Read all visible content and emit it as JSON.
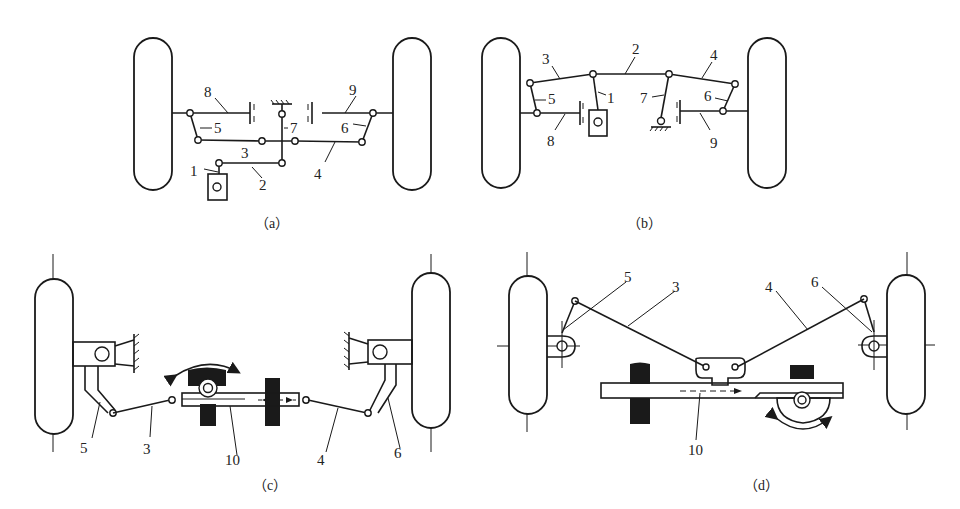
{
  "figure": {
    "panels": [
      {
        "id": "a",
        "caption": "（a）",
        "labels": {
          "n1": "1",
          "n2": "2",
          "n3": "3",
          "n4": "4",
          "n5": "5",
          "n6": "6",
          "n7": "7",
          "n8": "8",
          "n9": "9"
        }
      },
      {
        "id": "b",
        "caption": "（b）",
        "labels": {
          "n1": "1",
          "n2": "2",
          "n3": "3",
          "n4": "4",
          "n5": "5",
          "n6": "6",
          "n7": "7",
          "n8": "8",
          "n9": "9"
        }
      },
      {
        "id": "c",
        "caption": "（c）",
        "labels": {
          "n3": "3",
          "n4": "4",
          "n5": "5",
          "n6": "6",
          "n10": "10"
        }
      },
      {
        "id": "d",
        "caption": "（d）",
        "labels": {
          "n3": "3",
          "n4": "4",
          "n5": "5",
          "n6": "6",
          "n10": "10"
        }
      }
    ],
    "colors": {
      "line": "#1a1a1a",
      "background": "#ffffff"
    }
  }
}
